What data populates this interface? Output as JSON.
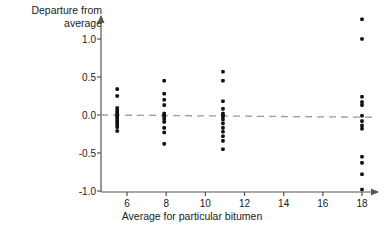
{
  "chart_data": {
    "type": "scatter",
    "title": "",
    "xlabel": "Average for particular bitumen",
    "ylabel": "Departure from average",
    "ylabel_line1": "Departure from",
    "ylabel_line2": "average",
    "xlim": [
      4.6,
      19.0
    ],
    "ylim": [
      -1.05,
      1.35
    ],
    "xticks": [
      6,
      8,
      10,
      12,
      14,
      16,
      18
    ],
    "xtick_labels": [
      "6",
      "8",
      "10",
      "12",
      "14",
      "16",
      "18"
    ],
    "yticks": [
      1.0,
      0.5,
      0.0,
      -0.5,
      -1.0
    ],
    "ytick_labels": [
      "1.0",
      "0.5",
      "0.0",
      "-0.5",
      "-1.0"
    ],
    "grid": false,
    "legend": false,
    "marker": "filled-square-dot",
    "marker_color": "#111111",
    "axis_color": "#555555",
    "reference_line": {
      "label": "zero departure",
      "style": "dashed",
      "color": "#9a9a9a",
      "y_left": 0.0,
      "y_right": -0.03
    },
    "groups": [
      {
        "name": "bitumen-group-5.5",
        "x": 5.5,
        "n": 14,
        "y_values": [
          0.34,
          0.25,
          0.09,
          0.06,
          0.03,
          0.01,
          -0.01,
          -0.03,
          -0.05,
          -0.08,
          -0.1,
          -0.13,
          -0.16,
          -0.21
        ]
      },
      {
        "name": "bitumen-group-7.9",
        "x": 7.9,
        "n": 12,
        "y_values": [
          0.45,
          0.28,
          0.2,
          0.13,
          0.02,
          0.0,
          -0.02,
          -0.05,
          -0.09,
          -0.17,
          -0.23,
          -0.38
        ]
      },
      {
        "name": "bitumen-group-10.9",
        "x": 10.9,
        "n": 14,
        "y_values": [
          0.57,
          0.45,
          0.18,
          0.08,
          0.02,
          0.0,
          -0.02,
          -0.06,
          -0.11,
          -0.17,
          -0.22,
          -0.28,
          -0.34,
          -0.45
        ]
      },
      {
        "name": "bitumen-group-18",
        "x": 18.0,
        "n": 12,
        "y_values": [
          1.26,
          1.0,
          0.24,
          0.17,
          0.13,
          -0.01,
          -0.08,
          -0.14,
          -0.18,
          -0.55,
          -0.63,
          -0.78,
          -0.98
        ]
      }
    ]
  }
}
